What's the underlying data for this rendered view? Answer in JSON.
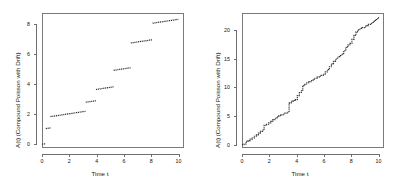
{
  "figure": {
    "background": "#ffffff",
    "panel_count": 2,
    "line_color": "#2b2b2b",
    "axis_color": "#6f6f6f"
  },
  "chart_data": [
    {
      "type": "line",
      "title": "",
      "subtitle": "",
      "xlabel": "Time t",
      "ylabel": "A(t) (Compound Poisson with Drift)",
      "xlim": [
        0,
        10.4
      ],
      "ylim": [
        -0.25,
        8.75
      ],
      "xticks": [
        0,
        2,
        4,
        6,
        8,
        10
      ],
      "xticklabels": [
        "0",
        "2",
        "4",
        "6",
        "8",
        "10"
      ],
      "yticks": [
        0,
        2,
        4,
        6,
        8
      ],
      "yticklabels": [
        "0",
        "2",
        "4",
        "6",
        "8"
      ],
      "grid": false,
      "legend": null,
      "annotations": [],
      "description": "Compound Poisson process with drift: few large jumps, piecewise linear drift segments",
      "jump_times": [
        0.28,
        0.62,
        3.2,
        3.95,
        5.25,
        6.5,
        8.1,
        10.0
      ],
      "jump_sizes": [
        1.0,
        0.75,
        0.6,
        0.75,
        1.1,
        1.65,
        1.1,
        0.0
      ],
      "drift_slope": 0.14,
      "segments": [
        {
          "x0": 0.0,
          "y0": 0.0,
          "x1": 0.28,
          "y1": 0.04
        },
        {
          "x0": 0.28,
          "y0": 1.04,
          "x1": 0.62,
          "y1": 1.09
        },
        {
          "x0": 0.62,
          "y0": 1.84,
          "x1": 3.2,
          "y1": 2.2
        },
        {
          "x0": 3.2,
          "y0": 2.8,
          "x1": 3.95,
          "y1": 2.9
        },
        {
          "x0": 3.95,
          "y0": 3.65,
          "x1": 5.25,
          "y1": 3.83
        },
        {
          "x0": 5.25,
          "y0": 4.93,
          "x1": 6.5,
          "y1": 5.1
        },
        {
          "x0": 6.5,
          "y0": 6.75,
          "x1": 8.1,
          "y1": 6.97
        },
        {
          "x0": 8.1,
          "y0": 8.07,
          "x1": 10.0,
          "y1": 8.33
        }
      ]
    },
    {
      "type": "line",
      "title": "",
      "subtitle": "",
      "xlabel": "Time t",
      "ylabel": "A(t) (Compound Poisson with Drift)",
      "xlim": [
        0,
        10.4
      ],
      "ylim": [
        -0.6,
        23.0
      ],
      "xticks": [
        0,
        2,
        4,
        6,
        8,
        10
      ],
      "xticklabels": [
        "0",
        "2",
        "4",
        "6",
        "8",
        "10"
      ],
      "yticks": [
        0,
        5,
        10,
        15,
        20
      ],
      "yticklabels": [
        "0",
        "5",
        "10",
        "15",
        "20"
      ],
      "grid": false,
      "legend": null,
      "annotations": [],
      "description": "Compound Poisson process with drift: many small frequent jumps, near-linear growth",
      "drift_slope": 2.2,
      "points": [
        [
          0.0,
          0.0
        ],
        [
          0.15,
          0.1
        ],
        [
          0.3,
          0.55
        ],
        [
          0.45,
          0.7
        ],
        [
          0.6,
          0.95
        ],
        [
          0.75,
          1.15
        ],
        [
          0.9,
          1.45
        ],
        [
          1.05,
          1.7
        ],
        [
          1.2,
          2.0
        ],
        [
          1.35,
          2.3
        ],
        [
          1.5,
          2.55
        ],
        [
          1.62,
          3.35
        ],
        [
          1.8,
          3.55
        ],
        [
          1.95,
          3.8
        ],
        [
          2.1,
          4.05
        ],
        [
          2.25,
          4.35
        ],
        [
          2.4,
          4.6
        ],
        [
          2.55,
          4.85
        ],
        [
          2.7,
          5.05
        ],
        [
          2.85,
          5.2
        ],
        [
          3.0,
          5.35
        ],
        [
          3.15,
          5.5
        ],
        [
          3.3,
          5.65
        ],
        [
          3.45,
          7.3
        ],
        [
          3.6,
          7.55
        ],
        [
          3.75,
          7.7
        ],
        [
          3.9,
          7.85
        ],
        [
          4.05,
          8.55
        ],
        [
          4.2,
          9.1
        ],
        [
          4.35,
          9.4
        ],
        [
          4.45,
          10.3
        ],
        [
          4.6,
          10.55
        ],
        [
          4.75,
          10.8
        ],
        [
          4.9,
          11.0
        ],
        [
          5.05,
          11.2
        ],
        [
          5.2,
          11.4
        ],
        [
          5.35,
          11.6
        ],
        [
          5.5,
          11.8
        ],
        [
          5.65,
          11.95
        ],
        [
          5.8,
          12.1
        ],
        [
          5.95,
          12.3
        ],
        [
          6.1,
          12.7
        ],
        [
          6.25,
          13.1
        ],
        [
          6.4,
          13.6
        ],
        [
          6.55,
          14.1
        ],
        [
          6.7,
          14.55
        ],
        [
          6.85,
          14.95
        ],
        [
          7.0,
          15.3
        ],
        [
          7.15,
          15.55
        ],
        [
          7.3,
          15.8
        ],
        [
          7.45,
          16.4
        ],
        [
          7.6,
          17.0
        ],
        [
          7.75,
          17.4
        ],
        [
          7.9,
          17.7
        ],
        [
          8.05,
          18.4
        ],
        [
          8.2,
          19.1
        ],
        [
          8.35,
          19.7
        ],
        [
          8.5,
          20.1
        ],
        [
          8.65,
          20.3
        ],
        [
          8.8,
          20.45
        ],
        [
          8.95,
          20.55
        ],
        [
          9.1,
          20.8
        ],
        [
          9.25,
          21.0
        ],
        [
          9.4,
          21.15
        ],
        [
          9.55,
          21.4
        ],
        [
          9.7,
          21.7
        ],
        [
          9.85,
          22.0
        ],
        [
          10.0,
          22.35
        ]
      ]
    }
  ]
}
